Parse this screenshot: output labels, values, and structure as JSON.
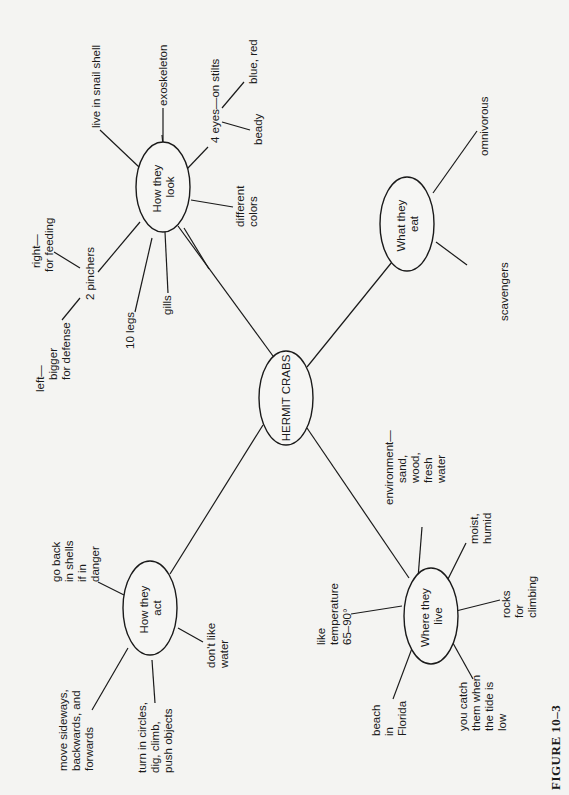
{
  "figure": {
    "caption": "FIGURE 10–3",
    "orientation": "rotated 90° (text reads bottom-to-top)"
  },
  "center": {
    "label": "HERMIT CRABS"
  },
  "branches": [
    {
      "id": "look",
      "label_lines": [
        "How they",
        "look"
      ],
      "items": [
        {
          "lines": [
            "live in snail shell"
          ]
        },
        {
          "lines": [
            "exoskeleton"
          ]
        },
        {
          "lines": [
            "4 eyes—on stilts"
          ],
          "sub": [
            {
              "lines": [
                "blue, red"
              ]
            },
            {
              "lines": [
                "beady"
              ]
            }
          ]
        },
        {
          "lines": [
            "different",
            "colors"
          ]
        },
        {
          "lines": [
            "gills"
          ]
        },
        {
          "lines": [
            "10 legs"
          ]
        },
        {
          "lines": [
            "2 pinchers"
          ],
          "sub": [
            {
              "lines": [
                "right—",
                "for feeding"
              ]
            },
            {
              "lines": [
                "left—",
                "bigger",
                "for defense"
              ]
            }
          ]
        }
      ]
    },
    {
      "id": "eat",
      "label_lines": [
        "What they",
        "eat"
      ],
      "items": [
        {
          "lines": [
            "omnivorous"
          ]
        },
        {
          "lines": [
            "scavengers"
          ]
        }
      ]
    },
    {
      "id": "act",
      "label_lines": [
        "How they",
        "act"
      ],
      "items": [
        {
          "lines": [
            "go back",
            "in shells",
            "if in",
            "danger"
          ]
        },
        {
          "lines": [
            "don't like",
            "water"
          ]
        },
        {
          "lines": [
            "move sideways,",
            "backwards, and",
            "forwards"
          ]
        },
        {
          "lines": [
            "turn in circles,",
            "dig, climb,",
            "push objects"
          ]
        }
      ]
    },
    {
      "id": "live",
      "label_lines": [
        "Where they",
        "live"
      ],
      "items": [
        {
          "lines": [
            "environment—",
            "sand,",
            "wood,",
            "fresh",
            "water"
          ]
        },
        {
          "lines": [
            "moist,",
            "humid"
          ]
        },
        {
          "lines": [
            "like",
            "temperature",
            "65–90°"
          ]
        },
        {
          "lines": [
            "rocks",
            "for",
            "climbing"
          ]
        },
        {
          "lines": [
            "beach",
            "in",
            "Florida"
          ]
        },
        {
          "lines": [
            "you catch",
            "them when",
            "the tide is",
            "low"
          ]
        }
      ]
    }
  ],
  "colors": {
    "background": "#f4f4f2",
    "ink": "#1a1a1a"
  }
}
